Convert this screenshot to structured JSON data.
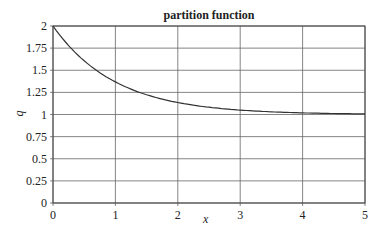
{
  "chart_data": {
    "type": "line",
    "title": "partition function",
    "xlabel": "x",
    "ylabel": "q",
    "xlim": [
      0,
      5
    ],
    "ylim": [
      0,
      2
    ],
    "xticks": [
      "0",
      "1",
      "2",
      "3",
      "4",
      "5"
    ],
    "yticks": [
      "0",
      "0.25",
      "0.5",
      "0.75",
      "1",
      "1.25",
      "1.5",
      "1.75",
      "2"
    ],
    "grid": true,
    "series": [
      {
        "name": "q(x) = 1 + e^(-x)",
        "x": [
          0,
          0.5,
          1,
          1.5,
          2,
          2.5,
          3,
          3.5,
          4,
          4.5,
          5
        ],
        "y": [
          2.0,
          1.61,
          1.37,
          1.22,
          1.14,
          1.08,
          1.05,
          1.03,
          1.02,
          1.01,
          1.01
        ]
      }
    ]
  }
}
